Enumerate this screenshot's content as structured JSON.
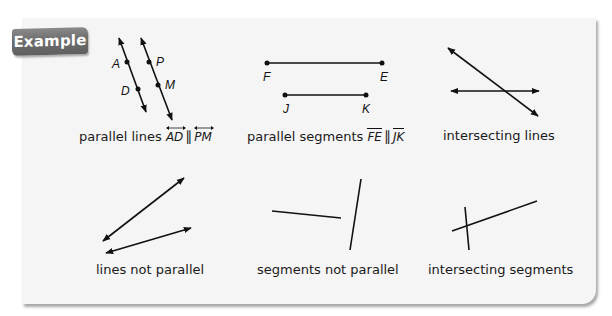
{
  "badge": {
    "label": "Example"
  },
  "examples": [
    {
      "caption": "parallel lines",
      "notation": {
        "a": "AD",
        "b": "PM",
        "symbol": "∥",
        "mark": "line"
      },
      "points": [
        "A",
        "D",
        "P",
        "M"
      ]
    },
    {
      "caption": "parallel segments",
      "notation": {
        "a": "FE",
        "b": "JK",
        "symbol": "∥",
        "mark": "segment"
      },
      "points": [
        "F",
        "E",
        "J",
        "K"
      ]
    },
    {
      "caption": "intersecting lines"
    },
    {
      "caption": "lines not parallel"
    },
    {
      "caption": "segments not parallel"
    },
    {
      "caption": "intersecting segments"
    }
  ],
  "colors": {
    "badge": "#6d6d6d",
    "card": "#f5f5f5",
    "stroke": "#111111"
  }
}
